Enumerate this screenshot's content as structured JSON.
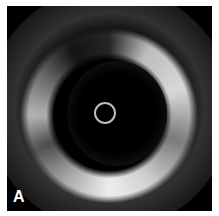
{
  "image": {
    "description": "Grayscale intravascular ultrasound cross-section with circular catheter artifact at center",
    "panel_label": "A",
    "colors": {
      "background": "#000000",
      "border": "#ffffff",
      "catheter_ring": "#bdbdbd"
    }
  }
}
